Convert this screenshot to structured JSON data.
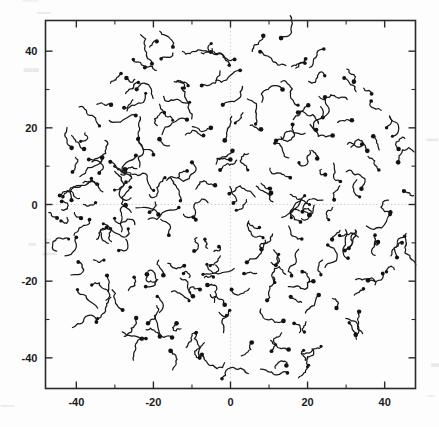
{
  "figure": {
    "background_color": "#fdfdfd",
    "ink_color": "#18181a",
    "grid_color": "#b9b9b9",
    "axis_color": "#2a2a2a"
  },
  "chart_data": {
    "type": "scatter",
    "title": "",
    "subtitle": "",
    "xlabel": "",
    "ylabel": "",
    "xlim": [
      -48,
      48
    ],
    "ylim": [
      -48,
      48
    ],
    "grid": "dotted-crosshair-at-origin",
    "legend": "none",
    "marker_style": "filled-dot-with-curved-trajectory-tail",
    "xticks": [
      -40,
      -20,
      0,
      20,
      40
    ],
    "xticklabels": [
      "-40",
      "-20",
      "0",
      "20",
      "40"
    ],
    "yticks": [
      -40,
      -20,
      0,
      20,
      40
    ],
    "yticklabels": [
      "-40",
      "-20",
      "0",
      "20",
      "40"
    ],
    "minor_tick_interval": 10,
    "tick_direction": "in",
    "frame": "full-box",
    "distribution_radius": 48,
    "point_count": 236,
    "points": [
      {
        "x": -43.5,
        "y": 2.0,
        "len": 6.0,
        "ang": 28
      },
      {
        "x": -45.0,
        "y": -3.5,
        "len": 3.0,
        "ang": 120
      },
      {
        "x": -42.0,
        "y": -9.0,
        "len": 7.5,
        "ang": 200
      },
      {
        "x": -41.0,
        "y": 8.5,
        "len": 4.5,
        "ang": 70
      },
      {
        "x": -38.0,
        "y": 14.5,
        "len": 5.0,
        "ang": 150
      },
      {
        "x": -39.5,
        "y": -15.0,
        "len": 6.5,
        "ang": 320
      },
      {
        "x": -36.0,
        "y": -21.0,
        "len": 5.5,
        "ang": 40
      },
      {
        "x": -34.0,
        "y": 20.5,
        "len": 8.0,
        "ang": 95
      },
      {
        "x": -35.0,
        "y": 0.5,
        "len": 3.5,
        "ang": 255
      },
      {
        "x": -33.0,
        "y": -5.0,
        "len": 6.0,
        "ang": 15
      },
      {
        "x": -31.0,
        "y": 26.0,
        "len": 4.0,
        "ang": 185
      },
      {
        "x": -30.0,
        "y": 10.0,
        "len": 7.0,
        "ang": 300
      },
      {
        "x": -29.0,
        "y": -12.0,
        "len": 5.0,
        "ang": 60
      },
      {
        "x": -28.0,
        "y": -27.5,
        "len": 6.5,
        "ang": 135
      },
      {
        "x": -27.0,
        "y": 33.0,
        "len": 3.0,
        "ang": 20
      },
      {
        "x": -26.0,
        "y": 4.5,
        "len": 8.5,
        "ang": 210
      },
      {
        "x": -25.0,
        "y": -19.0,
        "len": 4.5,
        "ang": 340
      },
      {
        "x": -24.0,
        "y": 17.0,
        "len": 6.0,
        "ang": 80
      },
      {
        "x": -23.0,
        "y": -35.0,
        "len": 5.5,
        "ang": 160
      },
      {
        "x": -22.0,
        "y": 29.0,
        "len": 7.5,
        "ang": 265
      },
      {
        "x": -21.0,
        "y": -2.0,
        "len": 3.5,
        "ang": 45
      },
      {
        "x": -20.0,
        "y": 13.0,
        "len": 6.5,
        "ang": 190
      },
      {
        "x": -19.0,
        "y": -24.0,
        "len": 5.0,
        "ang": 310
      },
      {
        "x": -18.0,
        "y": 38.0,
        "len": 4.0,
        "ang": 100
      },
      {
        "x": -17.0,
        "y": 7.0,
        "len": 8.0,
        "ang": 230
      },
      {
        "x": -16.0,
        "y": -8.0,
        "len": 5.5,
        "ang": 35
      },
      {
        "x": -15.0,
        "y": 22.0,
        "len": 6.0,
        "ang": 170
      },
      {
        "x": -14.0,
        "y": -31.0,
        "len": 4.5,
        "ang": 290
      },
      {
        "x": -13.0,
        "y": 1.0,
        "len": 7.0,
        "ang": 55
      },
      {
        "x": -12.0,
        "y": -16.0,
        "len": 5.0,
        "ang": 205
      },
      {
        "x": -11.0,
        "y": 31.0,
        "len": 3.5,
        "ang": 125
      },
      {
        "x": -10.0,
        "y": 11.0,
        "len": 8.5,
        "ang": 330
      },
      {
        "x": -9.0,
        "y": -4.0,
        "len": 4.0,
        "ang": 75
      },
      {
        "x": -8.0,
        "y": -40.0,
        "len": 6.0,
        "ang": 215
      },
      {
        "x": -7.0,
        "y": 18.0,
        "len": 5.5,
        "ang": 145
      },
      {
        "x": -6.0,
        "y": -21.0,
        "len": 7.0,
        "ang": 25
      },
      {
        "x": -5.0,
        "y": 42.0,
        "len": 4.5,
        "ang": 250
      },
      {
        "x": -4.0,
        "y": 5.0,
        "len": 6.5,
        "ang": 110
      },
      {
        "x": -3.0,
        "y": -11.0,
        "len": 3.0,
        "ang": 300
      },
      {
        "x": -2.0,
        "y": 26.0,
        "len": 8.0,
        "ang": 65
      },
      {
        "x": -1.0,
        "y": -29.0,
        "len": 5.0,
        "ang": 180
      },
      {
        "x": 0.5,
        "y": 14.0,
        "len": 6.0,
        "ang": 285
      },
      {
        "x": 1.5,
        "y": -1.5,
        "len": 4.5,
        "ang": 40
      },
      {
        "x": 2.5,
        "y": 35.0,
        "len": 7.5,
        "ang": 155
      },
      {
        "x": 3.5,
        "y": -18.0,
        "len": 3.5,
        "ang": 320
      },
      {
        "x": 4.5,
        "y": 9.0,
        "len": 6.5,
        "ang": 90
      },
      {
        "x": 5.5,
        "y": -36.0,
        "len": 5.0,
        "ang": 225
      },
      {
        "x": 6.5,
        "y": 21.0,
        "len": 8.0,
        "ang": 50
      },
      {
        "x": 7.5,
        "y": -6.0,
        "len": 4.0,
        "ang": 175
      },
      {
        "x": 8.5,
        "y": 44.0,
        "len": 5.5,
        "ang": 305
      },
      {
        "x": 9.5,
        "y": -25.0,
        "len": 7.0,
        "ang": 85
      },
      {
        "x": 10.5,
        "y": 3.0,
        "len": 3.0,
        "ang": 200
      },
      {
        "x": 11.5,
        "y": 16.0,
        "len": 6.0,
        "ang": 30
      },
      {
        "x": 12.5,
        "y": -13.0,
        "len": 4.5,
        "ang": 260
      },
      {
        "x": 13.5,
        "y": 30.0,
        "len": 8.5,
        "ang": 140
      },
      {
        "x": 14.5,
        "y": -42.0,
        "len": 5.0,
        "ang": 15
      },
      {
        "x": 15.5,
        "y": 7.0,
        "len": 6.5,
        "ang": 195
      },
      {
        "x": 16.5,
        "y": -31.0,
        "len": 3.5,
        "ang": 335
      },
      {
        "x": 17.5,
        "y": 24.0,
        "len": 7.0,
        "ang": 70
      },
      {
        "x": 18.5,
        "y": -9.0,
        "len": 5.5,
        "ang": 165
      },
      {
        "x": 19.5,
        "y": 38.0,
        "len": 4.0,
        "ang": 280
      },
      {
        "x": 20.5,
        "y": 0.0,
        "len": 6.0,
        "ang": 105
      },
      {
        "x": 21.5,
        "y": -20.0,
        "len": 8.0,
        "ang": 240
      },
      {
        "x": 22.5,
        "y": 12.0,
        "len": 3.0,
        "ang": 55
      },
      {
        "x": 23.5,
        "y": -37.0,
        "len": 5.5,
        "ang": 185
      },
      {
        "x": 24.5,
        "y": 28.0,
        "len": 6.5,
        "ang": 315
      },
      {
        "x": 25.5,
        "y": -4.0,
        "len": 4.5,
        "ang": 95
      },
      {
        "x": 26.5,
        "y": 18.0,
        "len": 7.5,
        "ang": 220
      },
      {
        "x": 27.5,
        "y": -27.0,
        "len": 3.5,
        "ang": 45
      },
      {
        "x": 28.5,
        "y": 6.0,
        "len": 6.0,
        "ang": 170
      },
      {
        "x": 29.5,
        "y": 33.0,
        "len": 5.0,
        "ang": 295
      },
      {
        "x": 30.5,
        "y": -14.0,
        "len": 8.0,
        "ang": 80
      },
      {
        "x": 31.5,
        "y": 22.0,
        "len": 4.0,
        "ang": 205
      },
      {
        "x": 32.5,
        "y": -34.0,
        "len": 6.5,
        "ang": 35
      },
      {
        "x": 33.5,
        "y": 2.0,
        "len": 5.5,
        "ang": 150
      },
      {
        "x": 34.5,
        "y": -22.0,
        "len": 3.0,
        "ang": 275
      },
      {
        "x": 35.5,
        "y": 14.0,
        "len": 7.0,
        "ang": 60
      },
      {
        "x": 36.5,
        "y": 27.0,
        "len": 4.5,
        "ang": 190
      },
      {
        "x": 37.5,
        "y": -8.0,
        "len": 6.0,
        "ang": 325
      },
      {
        "x": 38.5,
        "y": 9.0,
        "len": 5.0,
        "ang": 115
      },
      {
        "x": 39.5,
        "y": -18.0,
        "len": 8.5,
        "ang": 245
      },
      {
        "x": 40.5,
        "y": 20.0,
        "len": 3.5,
        "ang": 25
      },
      {
        "x": 41.5,
        "y": -2.0,
        "len": 6.0,
        "ang": 160
      },
      {
        "x": 42.5,
        "y": -26.0,
        "len": 4.0,
        "ang": 300
      },
      {
        "x": 43.5,
        "y": 11.0,
        "len": 7.0,
        "ang": 75
      },
      {
        "x": 44.5,
        "y": -10.0,
        "len": 5.0,
        "ang": 210
      },
      {
        "x": 45.0,
        "y": 3.5,
        "len": 3.0,
        "ang": 40
      }
    ]
  }
}
